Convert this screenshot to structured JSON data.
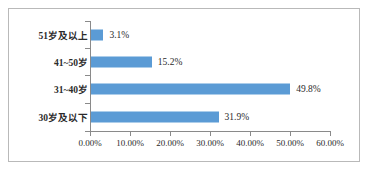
{
  "chart_data": {
    "type": "bar",
    "orientation": "horizontal",
    "title": "",
    "xlabel": "",
    "ylabel": "",
    "categories": [
      "30岁及以下",
      "31~40岁",
      "41~50岁",
      "51岁及以上"
    ],
    "values": [
      31.9,
      49.8,
      15.2,
      3.1
    ],
    "value_labels": [
      "31.9%",
      "49.8%",
      "15.2%",
      "3.1%"
    ],
    "xlim": [
      0,
      60
    ],
    "xticks": [
      0,
      10,
      20,
      30,
      40,
      50,
      60
    ],
    "xtick_labels": [
      "0.00%",
      "10.00%",
      "20.00%",
      "30.00%",
      "40.00%",
      "50.00%",
      "60.00%"
    ],
    "grid": false,
    "legend": false,
    "bar_color": "#5B9BD5",
    "axis_color": "#8A8A8A",
    "text_color": "#2B2B2B",
    "frame_color": "#B9B9B9",
    "background": "#FFFFFF"
  }
}
